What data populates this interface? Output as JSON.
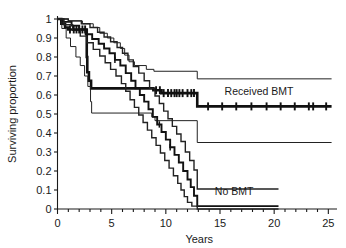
{
  "chart_data": {
    "type": "line",
    "title": "",
    "xlabel": "Years",
    "ylabel": "Surviving proportion",
    "xlim": [
      0,
      25.8
    ],
    "ylim": [
      0,
      1
    ],
    "grid": false,
    "legend_position": "inline-annotation",
    "x_ticks": [
      "0",
      "5",
      "10",
      "15",
      "20",
      "25"
    ],
    "x_tick_values": [
      0,
      5,
      10,
      15,
      20,
      25
    ],
    "x_minor_tick_interval": 1,
    "y_ticks": [
      "0",
      "0.1",
      "0.2",
      "0.3",
      "0.4",
      "0.5",
      "0.6",
      "0.7",
      "0.8",
      "0.9",
      "1"
    ],
    "y_tick_values": [
      0,
      0.1,
      0.2,
      0.3,
      0.4,
      0.5,
      0.6,
      0.7,
      0.8,
      0.9,
      1
    ],
    "annotations": [
      {
        "name": "received-bmt-label",
        "text": "Received BMT",
        "x": 18.6,
        "y": 0.6
      },
      {
        "name": "no-bmt-label",
        "text": "No BMT",
        "x": 16.3,
        "y": 0.075
      }
    ],
    "series": [
      {
        "name": "Received BMT",
        "style": "bold",
        "color": "#111111",
        "width": 2.6,
        "censor_marks_x": [
          1.15,
          1.5,
          1.75,
          2.0,
          2.3,
          2.55,
          9.1,
          9.45,
          9.8,
          10.2,
          10.5,
          10.8,
          11.0,
          11.25,
          11.55,
          12.0,
          12.35,
          12.6,
          13.9,
          15.2,
          16.5,
          17.9,
          19.3,
          20.6,
          21.9,
          23.2,
          23.6,
          24.8
        ],
        "points": [
          [
            0,
            1.0
          ],
          [
            0.35,
            1.0
          ],
          [
            0.35,
            0.975
          ],
          [
            0.7,
            0.975
          ],
          [
            0.7,
            0.955
          ],
          [
            1.0,
            0.955
          ],
          [
            1.0,
            0.945
          ],
          [
            2.7,
            0.945
          ],
          [
            2.7,
            0.8
          ],
          [
            2.75,
            0.8
          ],
          [
            2.75,
            0.72
          ],
          [
            2.9,
            0.72
          ],
          [
            2.9,
            0.675
          ],
          [
            3.1,
            0.675
          ],
          [
            3.1,
            0.635
          ],
          [
            8.85,
            0.635
          ],
          [
            8.85,
            0.625
          ],
          [
            9.6,
            0.625
          ],
          [
            9.6,
            0.61
          ],
          [
            12.9,
            0.61
          ],
          [
            12.9,
            0.54
          ],
          [
            25.3,
            0.54
          ]
        ]
      },
      {
        "name": "Received BMT upper 95% CI",
        "style": "thin",
        "color": "#222222",
        "width": 1.0,
        "points": [
          [
            0,
            1.0
          ],
          [
            1.0,
            1.0
          ],
          [
            1.0,
            0.99
          ],
          [
            2.3,
            0.99
          ],
          [
            2.3,
            0.975
          ],
          [
            3.3,
            0.975
          ],
          [
            3.3,
            0.955
          ],
          [
            3.9,
            0.955
          ],
          [
            3.9,
            0.925
          ],
          [
            4.6,
            0.925
          ],
          [
            4.6,
            0.9
          ],
          [
            5.2,
            0.9
          ],
          [
            5.2,
            0.875
          ],
          [
            5.8,
            0.875
          ],
          [
            5.8,
            0.845
          ],
          [
            6.2,
            0.845
          ],
          [
            6.2,
            0.81
          ],
          [
            6.6,
            0.81
          ],
          [
            6.6,
            0.775
          ],
          [
            7.1,
            0.775
          ],
          [
            7.1,
            0.755
          ],
          [
            8.2,
            0.755
          ],
          [
            8.2,
            0.735
          ],
          [
            8.9,
            0.735
          ],
          [
            8.9,
            0.725
          ],
          [
            12.9,
            0.725
          ],
          [
            12.9,
            0.685
          ],
          [
            25.3,
            0.685
          ]
        ]
      },
      {
        "name": "Received BMT lower 95% CI",
        "style": "thin",
        "color": "#222222",
        "width": 1.0,
        "points": [
          [
            0,
            1.0
          ],
          [
            0.4,
            1.0
          ],
          [
            0.4,
            0.95
          ],
          [
            0.8,
            0.95
          ],
          [
            0.8,
            0.9
          ],
          [
            1.2,
            0.9
          ],
          [
            1.2,
            0.855
          ],
          [
            1.7,
            0.855
          ],
          [
            1.7,
            0.8
          ],
          [
            2.1,
            0.8
          ],
          [
            2.1,
            0.755
          ],
          [
            2.5,
            0.755
          ],
          [
            2.5,
            0.7
          ],
          [
            2.8,
            0.7
          ],
          [
            2.8,
            0.645
          ],
          [
            3.05,
            0.645
          ],
          [
            3.05,
            0.565
          ],
          [
            3.15,
            0.565
          ],
          [
            3.15,
            0.505
          ],
          [
            8.7,
            0.505
          ],
          [
            8.7,
            0.485
          ],
          [
            9.0,
            0.485
          ],
          [
            9.0,
            0.465
          ],
          [
            12.9,
            0.465
          ],
          [
            12.9,
            0.35
          ],
          [
            25.3,
            0.35
          ]
        ]
      },
      {
        "name": "No BMT",
        "style": "medium",
        "color": "#111111",
        "width": 1.9,
        "censor_marks_x": [
          5.3,
          9.4,
          10.4
        ],
        "points": [
          [
            0,
            1.0
          ],
          [
            0.5,
            1.0
          ],
          [
            0.5,
            0.985
          ],
          [
            1.3,
            0.985
          ],
          [
            1.3,
            0.965
          ],
          [
            2.0,
            0.965
          ],
          [
            2.0,
            0.945
          ],
          [
            2.6,
            0.945
          ],
          [
            2.6,
            0.92
          ],
          [
            3.2,
            0.92
          ],
          [
            3.2,
            0.895
          ],
          [
            3.8,
            0.895
          ],
          [
            3.8,
            0.87
          ],
          [
            4.3,
            0.87
          ],
          [
            4.3,
            0.845
          ],
          [
            4.8,
            0.845
          ],
          [
            4.8,
            0.82
          ],
          [
            5.3,
            0.82
          ],
          [
            5.3,
            0.785
          ],
          [
            5.8,
            0.785
          ],
          [
            5.8,
            0.755
          ],
          [
            6.3,
            0.755
          ],
          [
            6.3,
            0.715
          ],
          [
            6.8,
            0.715
          ],
          [
            6.8,
            0.675
          ],
          [
            7.2,
            0.675
          ],
          [
            7.2,
            0.635
          ],
          [
            7.6,
            0.635
          ],
          [
            7.6,
            0.6
          ],
          [
            8.0,
            0.6
          ],
          [
            8.0,
            0.565
          ],
          [
            8.4,
            0.565
          ],
          [
            8.4,
            0.525
          ],
          [
            8.8,
            0.525
          ],
          [
            8.8,
            0.485
          ],
          [
            9.2,
            0.485
          ],
          [
            9.2,
            0.445
          ],
          [
            9.6,
            0.445
          ],
          [
            9.6,
            0.405
          ],
          [
            10.0,
            0.405
          ],
          [
            10.0,
            0.365
          ],
          [
            10.4,
            0.365
          ],
          [
            10.4,
            0.325
          ],
          [
            10.8,
            0.325
          ],
          [
            10.8,
            0.285
          ],
          [
            11.2,
            0.285
          ],
          [
            11.2,
            0.245
          ],
          [
            11.6,
            0.245
          ],
          [
            11.6,
            0.2
          ],
          [
            12.0,
            0.2
          ],
          [
            12.0,
            0.155
          ],
          [
            12.3,
            0.155
          ],
          [
            12.3,
            0.115
          ],
          [
            12.6,
            0.115
          ],
          [
            12.6,
            0.07
          ],
          [
            12.9,
            0.07
          ],
          [
            12.9,
            0.015
          ],
          [
            20.4,
            0.015
          ]
        ]
      },
      {
        "name": "No BMT upper 95% CI",
        "style": "thin",
        "color": "#222222",
        "width": 1.4,
        "points": [
          [
            0,
            1.0
          ],
          [
            1.0,
            1.0
          ],
          [
            1.0,
            0.99
          ],
          [
            2.2,
            0.99
          ],
          [
            2.2,
            0.975
          ],
          [
            3.0,
            0.975
          ],
          [
            3.0,
            0.955
          ],
          [
            3.7,
            0.955
          ],
          [
            3.7,
            0.93
          ],
          [
            4.3,
            0.93
          ],
          [
            4.3,
            0.905
          ],
          [
            4.9,
            0.905
          ],
          [
            4.9,
            0.88
          ],
          [
            5.5,
            0.88
          ],
          [
            5.5,
            0.85
          ],
          [
            6.0,
            0.85
          ],
          [
            6.0,
            0.82
          ],
          [
            6.5,
            0.82
          ],
          [
            6.5,
            0.785
          ],
          [
            7.0,
            0.785
          ],
          [
            7.0,
            0.75
          ],
          [
            7.5,
            0.75
          ],
          [
            7.5,
            0.715
          ],
          [
            8.0,
            0.715
          ],
          [
            8.0,
            0.675
          ],
          [
            8.5,
            0.675
          ],
          [
            8.5,
            0.635
          ],
          [
            9.0,
            0.635
          ],
          [
            9.0,
            0.595
          ],
          [
            9.4,
            0.595
          ],
          [
            9.4,
            0.555
          ],
          [
            9.8,
            0.555
          ],
          [
            9.8,
            0.515
          ],
          [
            10.2,
            0.515
          ],
          [
            10.2,
            0.475
          ],
          [
            10.6,
            0.475
          ],
          [
            10.6,
            0.435
          ],
          [
            11.0,
            0.435
          ],
          [
            11.0,
            0.395
          ],
          [
            11.4,
            0.395
          ],
          [
            11.4,
            0.355
          ],
          [
            11.8,
            0.355
          ],
          [
            11.8,
            0.3
          ],
          [
            12.2,
            0.3
          ],
          [
            12.2,
            0.255
          ],
          [
            12.6,
            0.255
          ],
          [
            12.6,
            0.205
          ],
          [
            12.9,
            0.205
          ],
          [
            12.9,
            0.105
          ],
          [
            20.4,
            0.105
          ]
        ]
      },
      {
        "name": "No BMT lower 95% CI",
        "style": "thin",
        "color": "#222222",
        "width": 1.4,
        "points": [
          [
            0,
            1.0
          ],
          [
            0.6,
            1.0
          ],
          [
            0.6,
            0.97
          ],
          [
            1.4,
            0.97
          ],
          [
            1.4,
            0.94
          ],
          [
            2.1,
            0.94
          ],
          [
            2.1,
            0.91
          ],
          [
            2.7,
            0.91
          ],
          [
            2.7,
            0.875
          ],
          [
            3.3,
            0.875
          ],
          [
            3.3,
            0.84
          ],
          [
            3.9,
            0.84
          ],
          [
            3.9,
            0.805
          ],
          [
            4.4,
            0.805
          ],
          [
            4.4,
            0.77
          ],
          [
            4.9,
            0.77
          ],
          [
            4.9,
            0.735
          ],
          [
            5.4,
            0.735
          ],
          [
            5.4,
            0.7
          ],
          [
            5.9,
            0.7
          ],
          [
            5.9,
            0.66
          ],
          [
            6.3,
            0.66
          ],
          [
            6.3,
            0.62
          ],
          [
            6.7,
            0.62
          ],
          [
            6.7,
            0.575
          ],
          [
            7.1,
            0.575
          ],
          [
            7.1,
            0.535
          ],
          [
            7.5,
            0.535
          ],
          [
            7.5,
            0.495
          ],
          [
            7.9,
            0.495
          ],
          [
            7.9,
            0.455
          ],
          [
            8.3,
            0.455
          ],
          [
            8.3,
            0.415
          ],
          [
            8.7,
            0.415
          ],
          [
            8.7,
            0.375
          ],
          [
            9.1,
            0.375
          ],
          [
            9.1,
            0.335
          ],
          [
            9.5,
            0.335
          ],
          [
            9.5,
            0.295
          ],
          [
            9.9,
            0.295
          ],
          [
            9.9,
            0.255
          ],
          [
            10.3,
            0.255
          ],
          [
            10.3,
            0.215
          ],
          [
            10.7,
            0.215
          ],
          [
            10.7,
            0.175
          ],
          [
            11.1,
            0.175
          ],
          [
            11.1,
            0.135
          ],
          [
            11.4,
            0.135
          ],
          [
            11.4,
            0.1
          ],
          [
            11.7,
            0.1
          ],
          [
            11.7,
            0.065
          ],
          [
            12.0,
            0.065
          ],
          [
            12.0,
            0.035
          ],
          [
            12.4,
            0.035
          ],
          [
            12.4,
            0.015
          ],
          [
            12.9,
            0.015
          ],
          [
            12.9,
            0.0
          ],
          [
            20.4,
            0.0
          ]
        ]
      }
    ]
  }
}
